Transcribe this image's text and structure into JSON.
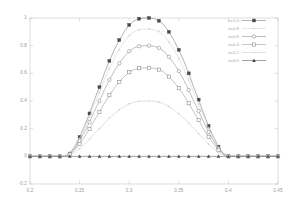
{
  "chart_data": {
    "type": "line",
    "title": "",
    "xlabel": "",
    "ylabel": "",
    "xlim": [
      0.2,
      0.45
    ],
    "ylim": [
      -0.2,
      1.0
    ],
    "grid": false,
    "legend_position": "top-right",
    "xticks": [
      "0.2",
      "0.25",
      "0.3",
      "0.35",
      "0.4",
      "0.45"
    ],
    "xtick_values": [
      0.2,
      0.25,
      0.3,
      0.35,
      0.4,
      0.45
    ],
    "yticks": [
      "1",
      "0.8",
      "0.6",
      "0.4",
      "0.2",
      "0",
      "-0.2"
    ],
    "ytick_values": [
      1,
      0.8,
      0.6,
      0.4,
      0.2,
      0,
      -0.2
    ],
    "x": [
      0.2,
      0.205,
      0.21,
      0.215,
      0.22,
      0.225,
      0.23,
      0.235,
      0.24,
      0.245,
      0.25,
      0.255,
      0.26,
      0.265,
      0.27,
      0.275,
      0.28,
      0.285,
      0.29,
      0.295,
      0.3,
      0.305,
      0.31,
      0.315,
      0.32,
      0.325,
      0.33,
      0.335,
      0.34,
      0.345,
      0.35,
      0.355,
      0.36,
      0.365,
      0.37,
      0.375,
      0.38,
      0.385,
      0.39,
      0.395,
      0.4,
      0.405,
      0.41,
      0.415,
      0.42,
      0.425,
      0.43,
      0.435,
      0.44,
      0.445,
      0.45
    ],
    "series": [
      {
        "name": "n=1.0",
        "marker": "filled-square",
        "color": "#8a8a8a",
        "peak": 1.0,
        "values": [
          0,
          0,
          0,
          0,
          0,
          0,
          0,
          0,
          0.02,
          0.07,
          0.14,
          0.22,
          0.31,
          0.41,
          0.5,
          0.6,
          0.69,
          0.77,
          0.84,
          0.9,
          0.95,
          0.98,
          0.995,
          1.0,
          1.0,
          0.995,
          0.98,
          0.95,
          0.9,
          0.84,
          0.77,
          0.69,
          0.6,
          0.5,
          0.41,
          0.31,
          0.22,
          0.14,
          0.07,
          0.02,
          0,
          0,
          0,
          0,
          0,
          0,
          0,
          0,
          0,
          0,
          0
        ]
      },
      {
        "name": "n=0.8",
        "marker": "dot",
        "color": "#d8d8d8",
        "peak": 0.92,
        "values": [
          0,
          0,
          0,
          0,
          0,
          0,
          0,
          0,
          0.018,
          0.064,
          0.129,
          0.202,
          0.285,
          0.377,
          0.46,
          0.552,
          0.635,
          0.708,
          0.773,
          0.828,
          0.874,
          0.902,
          0.915,
          0.92,
          0.92,
          0.915,
          0.902,
          0.874,
          0.828,
          0.773,
          0.708,
          0.635,
          0.552,
          0.46,
          0.377,
          0.285,
          0.202,
          0.129,
          0.064,
          0.018,
          0,
          0,
          0,
          0,
          0,
          0,
          0,
          0,
          0,
          0,
          0
        ]
      },
      {
        "name": "n=0.6",
        "marker": "open-circle",
        "color": "#9e9e9e",
        "peak": 0.8,
        "values": [
          0,
          0,
          0,
          0,
          0,
          0,
          0,
          0,
          0.016,
          0.056,
          0.112,
          0.176,
          0.248,
          0.328,
          0.4,
          0.48,
          0.552,
          0.616,
          0.672,
          0.72,
          0.76,
          0.784,
          0.796,
          0.8,
          0.8,
          0.796,
          0.784,
          0.76,
          0.72,
          0.672,
          0.616,
          0.552,
          0.48,
          0.4,
          0.328,
          0.248,
          0.176,
          0.112,
          0.056,
          0.016,
          0,
          0,
          0,
          0,
          0,
          0,
          0,
          0,
          0,
          0,
          0
        ]
      },
      {
        "name": "n=0.4",
        "marker": "open-square",
        "color": "#a5a5a5",
        "peak": 0.64,
        "values": [
          0,
          0,
          0,
          0,
          0,
          0,
          0,
          0,
          0.013,
          0.045,
          0.09,
          0.141,
          0.198,
          0.262,
          0.32,
          0.384,
          0.442,
          0.493,
          0.538,
          0.576,
          0.608,
          0.627,
          0.637,
          0.64,
          0.64,
          0.637,
          0.627,
          0.608,
          0.576,
          0.538,
          0.493,
          0.442,
          0.384,
          0.32,
          0.262,
          0.198,
          0.141,
          0.09,
          0.045,
          0.013,
          0,
          0,
          0,
          0,
          0,
          0,
          0,
          0,
          0,
          0,
          0
        ]
      },
      {
        "name": "n=0.2",
        "marker": "dot-small",
        "color": "#d0d0d0",
        "peak": 0.4,
        "values": [
          0,
          0,
          0,
          0,
          0,
          0,
          0,
          0,
          0.008,
          0.028,
          0.056,
          0.088,
          0.124,
          0.164,
          0.2,
          0.24,
          0.276,
          0.308,
          0.336,
          0.36,
          0.38,
          0.392,
          0.398,
          0.4,
          0.4,
          0.398,
          0.392,
          0.38,
          0.36,
          0.336,
          0.308,
          0.276,
          0.24,
          0.2,
          0.164,
          0.124,
          0.088,
          0.056,
          0.028,
          0.008,
          0,
          0,
          0,
          0,
          0,
          0,
          0,
          0,
          0,
          0,
          0
        ]
      },
      {
        "name": "n=0.0",
        "marker": "filled-triangle",
        "color": "#707070",
        "peak": 0.0,
        "values": [
          0,
          0,
          0,
          0,
          0,
          0,
          0,
          0,
          0,
          0,
          0,
          0,
          0,
          0,
          0,
          0,
          0,
          0,
          0,
          0,
          0,
          0,
          0,
          0,
          0,
          0,
          0,
          0,
          0,
          0,
          0,
          0,
          0,
          0,
          0,
          0,
          0,
          0,
          0,
          0,
          0,
          0,
          0,
          0,
          0,
          0,
          0,
          0,
          0,
          0,
          0
        ]
      }
    ]
  },
  "legend": {
    "entries": [
      {
        "label": "n=1.0"
      },
      {
        "label": "n=0.8"
      },
      {
        "label": "n=0.6"
      },
      {
        "label": "n=0.4"
      },
      {
        "label": "n=0.2"
      },
      {
        "label": "n=0.0"
      }
    ]
  },
  "axes": {
    "frame_color": "#cfcfcf",
    "tick_color": "#c8c8c8",
    "label_color": "#9a9a9a"
  }
}
